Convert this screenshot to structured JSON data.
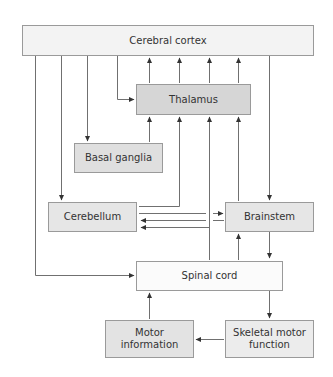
{
  "diagram": {
    "colors": {
      "line": "#555555",
      "border": "#9a9a9a",
      "text": "#333333"
    },
    "nodes": {
      "cortex": {
        "label": "Cerebral cortex",
        "fill": "#f3f3f3"
      },
      "thalamus": {
        "label": "Thalamus",
        "fill": "#d6d6d6"
      },
      "basal_ganglia": {
        "label": "Basal ganglia",
        "fill": "#dfdfdf"
      },
      "cerebellum": {
        "label": "Cerebellum",
        "fill": "#e6e6e6"
      },
      "brainstem": {
        "label": "Brainstem",
        "fill": "#e6e6e6"
      },
      "spinal_cord": {
        "label": "Spinal cord",
        "fill": "#fbfbfb"
      },
      "motor_info": {
        "label": "Motor information",
        "line1": "Motor",
        "line2": "information",
        "fill": "#e3e3e3"
      },
      "skeletal": {
        "label": "Skeletal motor function",
        "line1": "Skeletal motor",
        "line2": "function",
        "fill": "#ececec"
      }
    },
    "edges": [
      {
        "from": "Cerebral cortex",
        "to": "Spinal cord"
      },
      {
        "from": "Cerebral cortex",
        "to": "Cerebellum"
      },
      {
        "from": "Cerebral cortex",
        "to": "Basal ganglia"
      },
      {
        "from": "Cerebral cortex",
        "to": "Thalamus"
      },
      {
        "from": "Cerebral cortex",
        "to": "Brainstem"
      },
      {
        "from": "Thalamus",
        "to": "Cerebral cortex"
      },
      {
        "from": "Basal ganglia",
        "to": "Thalamus"
      },
      {
        "from": "Cerebellum",
        "to": "Thalamus"
      },
      {
        "from": "Spinal cord",
        "to": "Thalamus"
      },
      {
        "from": "Brainstem",
        "to": "Thalamus"
      },
      {
        "from": "Cerebellum",
        "to": "Brainstem"
      },
      {
        "from": "Brainstem",
        "to": "Cerebellum"
      },
      {
        "from": "Spinal cord",
        "to": "Cerebellum"
      },
      {
        "from": "Spinal cord",
        "to": "Brainstem"
      },
      {
        "from": "Brainstem",
        "to": "Spinal cord"
      },
      {
        "from": "Spinal cord",
        "to": "Skeletal motor function"
      },
      {
        "from": "Skeletal motor function",
        "to": "Motor information"
      },
      {
        "from": "Motor information",
        "to": "Spinal cord"
      }
    ]
  }
}
